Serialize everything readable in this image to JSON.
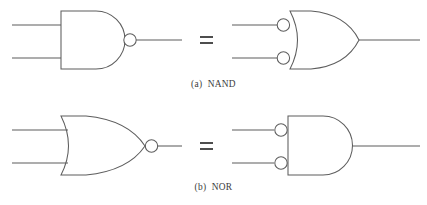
{
  "figure": {
    "type": "logic-gate-equivalence-diagram",
    "line_color": "#5d5d5d",
    "background_color": "#ffffff",
    "equals_color": "#3a3a3a",
    "rows": [
      {
        "id": "row-a",
        "caption": "(a)  NAND",
        "caption_index": "(a)",
        "caption_name": "NAND",
        "equals_symbol": "=",
        "left_gate": {
          "name": "nand-gate",
          "shape": "and",
          "output_bubble": true,
          "input_bubbles": false,
          "inputs": 2
        },
        "right_gate": {
          "name": "negative-or-gate",
          "shape": "or",
          "output_bubble": false,
          "input_bubbles": true,
          "inputs": 2
        }
      },
      {
        "id": "row-b",
        "caption": "(b)  NOR",
        "caption_index": "(b)",
        "caption_name": "NOR",
        "equals_symbol": "=",
        "left_gate": {
          "name": "nor-gate",
          "shape": "or",
          "output_bubble": true,
          "input_bubbles": false,
          "inputs": 2
        },
        "right_gate": {
          "name": "negative-and-gate",
          "shape": "and",
          "output_bubble": false,
          "input_bubbles": true,
          "inputs": 2
        }
      }
    ]
  }
}
